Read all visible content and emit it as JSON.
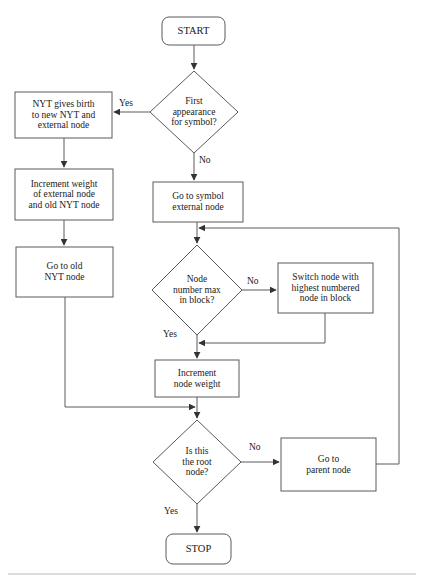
{
  "diagram": {
    "type": "flowchart",
    "canvas": {
      "width": 424,
      "height": 579
    },
    "style": {
      "stroke": "#555555",
      "text_color": "#1a1a1a",
      "background": "#ffffff",
      "font_size_node": 9.5,
      "font_size_label": 9.5
    },
    "corner_artifact": "",
    "nodes": [
      {
        "id": "start",
        "shape": "terminator",
        "text": "START",
        "x": 162,
        "y": 17,
        "w": 63,
        "h": 28,
        "font_size": 10.5
      },
      {
        "id": "first-appearance",
        "shape": "decision",
        "text": "First\nappearance\nfor symbol?",
        "cx": 194,
        "cy": 112,
        "rx": 44,
        "ry": 41,
        "font_size": 9.5
      },
      {
        "id": "nyt-gives-birth",
        "shape": "process",
        "text": "NYT gives birth\nto new NYT and\nexternal node",
        "x": 15,
        "y": 92,
        "w": 97,
        "h": 46,
        "font_size": 9.5
      },
      {
        "id": "increment-weight",
        "shape": "process",
        "text": "Increment weight\nof external node\nand old NYT node",
        "x": 15,
        "y": 169,
        "w": 98,
        "h": 51,
        "font_size": 9.5
      },
      {
        "id": "go-to-old-nyt",
        "shape": "process",
        "text": "Go to old\nNYT node",
        "x": 16,
        "y": 247,
        "w": 97,
        "h": 50,
        "font_size": 9.5
      },
      {
        "id": "go-to-symbol-external",
        "shape": "process",
        "text": "Go to symbol\nexternal node",
        "x": 153,
        "y": 182,
        "w": 90,
        "h": 40,
        "font_size": 9.5
      },
      {
        "id": "node-number-max",
        "shape": "decision",
        "text": "Node\nnumber max\nin block?",
        "cx": 197,
        "cy": 290,
        "rx": 45,
        "ry": 45,
        "font_size": 9.5
      },
      {
        "id": "switch-node",
        "shape": "process",
        "text": "Switch node with\nhighest numbered\nnode in block",
        "x": 278,
        "y": 263,
        "w": 95,
        "h": 50,
        "font_size": 9.5
      },
      {
        "id": "increment-node-weight",
        "shape": "process",
        "text": "Increment\nnode weight",
        "x": 155,
        "y": 360,
        "w": 84,
        "h": 37,
        "font_size": 9.5
      },
      {
        "id": "is-root",
        "shape": "decision",
        "text": "Is this\nthe root\nnode?",
        "cx": 197,
        "cy": 462,
        "rx": 44,
        "ry": 42,
        "font_size": 9.5
      },
      {
        "id": "go-to-parent",
        "shape": "process",
        "text": "Go to\nparent node",
        "x": 281,
        "y": 438,
        "w": 95,
        "h": 53,
        "font_size": 9.5
      },
      {
        "id": "stop",
        "shape": "terminator",
        "text": "STOP",
        "x": 166,
        "y": 534,
        "w": 65,
        "h": 30,
        "font_size": 10.5
      }
    ],
    "edge_labels": [
      {
        "id": "yes-first-appearance",
        "text": "Yes",
        "x": 119,
        "y": 98
      },
      {
        "id": "no-first-appearance",
        "text": "No",
        "x": 198,
        "y": 157
      },
      {
        "id": "no-node-number-max",
        "text": "No",
        "x": 246,
        "y": 277
      },
      {
        "id": "yes-node-number-max",
        "text": "Yes",
        "x": 163,
        "y": 330
      },
      {
        "id": "no-is-root",
        "text": "No",
        "x": 249,
        "y": 443
      },
      {
        "id": "yes-is-root",
        "text": "Yes",
        "x": 164,
        "y": 508
      }
    ],
    "edges": [
      {
        "id": "start-to-first-appearance",
        "from": "start",
        "to": "first-appearance"
      },
      {
        "id": "first-appearance-yes-to-nyt-gives-birth",
        "from": "first-appearance",
        "to": "nyt-gives-birth",
        "label": "Yes"
      },
      {
        "id": "first-appearance-no-to-go-to-symbol-external",
        "from": "first-appearance",
        "to": "go-to-symbol-external",
        "label": "No"
      },
      {
        "id": "nyt-gives-birth-to-increment-weight",
        "from": "nyt-gives-birth",
        "to": "increment-weight"
      },
      {
        "id": "increment-weight-to-go-to-old-nyt",
        "from": "increment-weight",
        "to": "go-to-old-nyt"
      },
      {
        "id": "go-to-old-nyt-to-is-root",
        "from": "go-to-old-nyt",
        "to": "is-root"
      },
      {
        "id": "go-to-symbol-external-to-node-number-max",
        "from": "go-to-symbol-external",
        "to": "node-number-max"
      },
      {
        "id": "node-number-max-no-to-switch-node",
        "from": "node-number-max",
        "to": "switch-node",
        "label": "No"
      },
      {
        "id": "switch-node-to-increment-node-weight",
        "from": "switch-node",
        "to": "increment-node-weight"
      },
      {
        "id": "node-number-max-yes-to-increment-node-weight",
        "from": "node-number-max",
        "to": "increment-node-weight",
        "label": "Yes"
      },
      {
        "id": "increment-node-weight-to-is-root",
        "from": "increment-node-weight",
        "to": "is-root"
      },
      {
        "id": "is-root-no-to-go-to-parent",
        "from": "is-root",
        "to": "go-to-parent",
        "label": "No"
      },
      {
        "id": "go-to-parent-to-node-number-max",
        "from": "go-to-parent",
        "to": "node-number-max"
      },
      {
        "id": "is-root-yes-to-stop",
        "from": "is-root",
        "to": "stop",
        "label": "Yes"
      }
    ]
  }
}
